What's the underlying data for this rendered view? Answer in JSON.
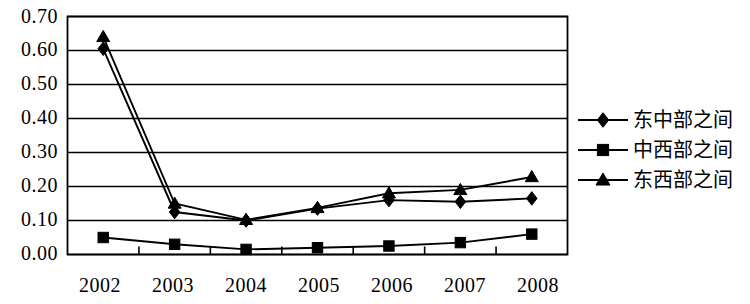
{
  "chart_data": {
    "type": "line",
    "title": "",
    "subtitle": "",
    "xlabel": "",
    "ylabel": "",
    "categories": [
      "2002",
      "2003",
      "2004",
      "2005",
      "2006",
      "2007",
      "2008"
    ],
    "ylim": [
      0.0,
      0.7
    ],
    "ytick_labels": [
      "0.70",
      "0.60",
      "0.50",
      "0.40",
      "0.30",
      "0.20",
      "0.10",
      "0.00"
    ],
    "ytick_values": [
      0.7,
      0.6,
      0.5,
      0.4,
      0.3,
      0.2,
      0.1,
      0.0
    ],
    "grid": true,
    "legend_position": "right",
    "series": [
      {
        "name": "东中部之间",
        "marker": "diamond",
        "color": "#000000",
        "values": [
          0.605,
          0.125,
          0.1,
          0.135,
          0.16,
          0.155,
          0.165
        ]
      },
      {
        "name": "中西部之间",
        "marker": "square",
        "color": "#000000",
        "values": [
          0.05,
          0.03,
          0.015,
          0.02,
          0.025,
          0.035,
          0.06
        ]
      },
      {
        "name": "东西部之间",
        "marker": "triangle",
        "color": "#000000",
        "values": [
          0.64,
          0.15,
          0.102,
          0.137,
          0.18,
          0.19,
          0.228
        ]
      }
    ]
  },
  "legend": {
    "items": [
      {
        "label": "东中部之间",
        "marker": "diamond"
      },
      {
        "label": "中西部之间",
        "marker": "square"
      },
      {
        "label": "东西部之间",
        "marker": "triangle"
      }
    ]
  }
}
